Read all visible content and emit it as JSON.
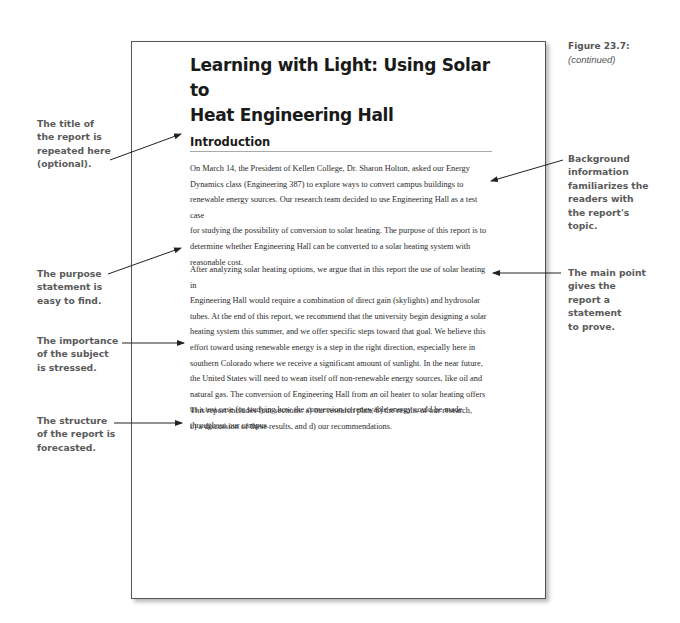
{
  "figure": {
    "number": "Figure 23.7:",
    "continued": "(continued)"
  },
  "document": {
    "title_lines": [
      "Learning with Light: Using Solar to",
      "Heat Engineering Hall"
    ],
    "section_heading": "Introduction",
    "paragraphs": [
      [
        "On March 14, the President of Kellen College, Dr. Sharon Holton, asked our Energy",
        "Dynamics class (Engineering 387) to explore ways to convert campus buildings to",
        "renewable energy sources. Our research team decided to use Engineering Hall as a test case",
        "for studying the possibility of conversion to solar heating.  The purpose of this report is to",
        "determine whether Engineering Hall can be converted to a solar heating system with",
        "reasonable cost."
      ],
      [
        "After analyzing solar heating options, we argue that in this report the use of solar heating in",
        "Engineering Hall would require a combination of direct gain (skylights) and hydrosolar",
        "tubes. At the end of this report, we recommend that the university begin designing a solar",
        "heating system this summer, and we offer specific steps toward that goal. We believe this",
        "effort toward using renewable energy is a step in the right direction, especially here in",
        "southern Colorado where we receive a significant amount of sunlight. In the near future,",
        "the United States will need to wean itself off non-renewable energy sources, like oil and",
        "natural gas. The conversion of Engineering Hall  from an oil heater to solar heating offers",
        "us a test case for studying how the conversion to renewable energy could be made",
        "throughout our campus."
      ],
      [
        "This report includes four sections: a) our research plan, b) the results of our research,",
        "c) a discussion of these results, and d) our recommendations."
      ]
    ]
  },
  "annotations": {
    "left": [
      {
        "id": "title-repeated",
        "lines": [
          "The title of",
          "the report is",
          "repeated here",
          "(optional)."
        ]
      },
      {
        "id": "purpose-statement",
        "lines": [
          "The purpose",
          "statement is",
          "easy to find."
        ]
      },
      {
        "id": "importance",
        "lines": [
          "The importance",
          "of the subject",
          "is stressed."
        ]
      },
      {
        "id": "structure",
        "lines": [
          "The structure",
          "of the report is",
          "forecasted."
        ]
      }
    ],
    "right": [
      {
        "id": "background",
        "lines": [
          "Background",
          "information",
          "familiarizes the",
          "readers with",
          "the report's",
          "topic."
        ]
      },
      {
        "id": "main-point",
        "lines": [
          "The main point",
          "gives the",
          "report a",
          "statement",
          "to prove."
        ]
      }
    ]
  },
  "colors": {
    "annotation_text": "#5a5a5a",
    "body_text": "#2a2a2a",
    "page_border": "#555555",
    "arrow": "#222222"
  }
}
